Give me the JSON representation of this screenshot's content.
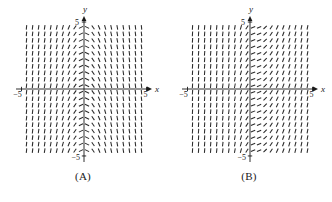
{
  "figure": {
    "background_color": "#ffffff",
    "ink_color": "#1a1a1a",
    "panels": [
      {
        "id": "A",
        "caption": "(A)",
        "axes": {
          "x_name": "x",
          "y_name": "y",
          "x_tick_left_label": "−5",
          "x_tick_right_label": "5",
          "y_tick_top_label": "5",
          "y_tick_bottom_label": "−5",
          "xlim": [
            -5.6,
            5.6
          ],
          "ylim": [
            -5.6,
            5.6
          ],
          "grid": false,
          "arrowheads": true
        }
      },
      {
        "id": "B",
        "caption": "(B)",
        "axes": {
          "x_name": "x",
          "y_name": "y",
          "x_tick_left_label": "−5",
          "x_tick_right_label": "5",
          "y_tick_top_label": "5",
          "y_tick_bottom_label": "−5",
          "xlim": [
            -5.6,
            5.6
          ],
          "ylim": [
            -5.6,
            5.6
          ],
          "grid": false,
          "arrowheads": true
        }
      }
    ]
  },
  "chart_data": [
    {
      "type": "scatter",
      "plot_kind": "slope-field",
      "panel": "A",
      "title": "(A)",
      "xlabel": "x",
      "ylabel": "y",
      "xlim": [
        -5.6,
        5.6
      ],
      "ylim": [
        -5.6,
        5.6
      ],
      "grid": false,
      "x_ticks": [
        -5,
        5
      ],
      "x_tick_labels": [
        "−5",
        "5"
      ],
      "y_ticks": [
        -5,
        5
      ],
      "y_tick_labels": [
        "−5",
        "5"
      ],
      "mark_grid": {
        "x_start": -4.6,
        "x_end": 4.6,
        "x_count": 20,
        "y_start": -4.6,
        "y_end": 4.6,
        "y_count": 20
      },
      "slope_rule": "slope depends on x only; dy/dx = -2x (steep positive left of y-axis, steep negative right of y-axis, shallow near x=0)",
      "slope_profile": {
        "x": [
          -4.6,
          -4.1,
          -3.6,
          -3.1,
          -2.6,
          -2.1,
          -1.6,
          -1.1,
          -0.6,
          -0.1,
          0.4,
          0.9,
          1.4,
          1.9,
          2.4,
          2.9,
          3.4,
          3.9,
          4.4,
          4.6
        ],
        "dydx": [
          9.2,
          8.2,
          7.2,
          6.2,
          5.2,
          4.2,
          3.2,
          2.2,
          1.2,
          0.2,
          -0.8,
          -1.8,
          -2.8,
          -3.8,
          -4.8,
          -5.8,
          -6.8,
          -7.8,
          -8.8,
          -9.2
        ]
      },
      "columns_uniform_in_y": true,
      "mark_length_px": 4.6,
      "mark_color": "#2a2a2a"
    },
    {
      "type": "scatter",
      "plot_kind": "slope-field",
      "panel": "B",
      "title": "(B)",
      "xlabel": "x",
      "ylabel": "y",
      "xlim": [
        -5.6,
        5.6
      ],
      "ylim": [
        -5.6,
        5.6
      ],
      "grid": false,
      "x_ticks": [
        -5,
        5
      ],
      "x_tick_labels": [
        "−5",
        "5"
      ],
      "y_ticks": [
        -5,
        5
      ],
      "y_tick_labels": [
        "−5",
        "5"
      ],
      "mark_grid": {
        "x_start": -4.6,
        "x_end": 4.6,
        "x_count": 20,
        "y_start": -4.6,
        "y_end": 4.6,
        "y_count": 20
      },
      "slope_rule": "slope depends on x only; near-vertical (very large positive slope) far left, decreasing to 0 (horizontal) just right of the y-axis, then rising again to moderate positive slope on the far right",
      "slope_profile": {
        "x": [
          -4.6,
          -4.1,
          -3.6,
          -3.1,
          -2.6,
          -2.1,
          -1.6,
          -1.1,
          -0.6,
          -0.1,
          0.4,
          0.9,
          1.4,
          1.9,
          2.4,
          2.9,
          3.4,
          3.9,
          4.4,
          4.6
        ],
        "dydx": [
          14.0,
          13.0,
          12.0,
          11.0,
          10.0,
          8.5,
          7.0,
          5.0,
          3.0,
          1.0,
          0.1,
          0.6,
          1.2,
          1.8,
          2.4,
          3.0,
          3.6,
          4.2,
          4.8,
          5.2
        ]
      },
      "columns_uniform_in_y": true,
      "mark_length_px": 4.6,
      "mark_color": "#2a2a2a"
    }
  ]
}
